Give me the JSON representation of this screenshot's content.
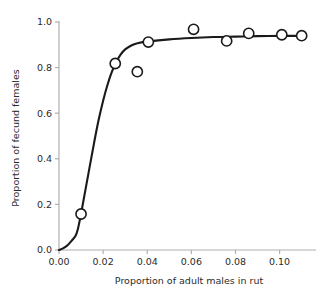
{
  "chart_data": {
    "type": "scatter",
    "title": "",
    "subtitle": "",
    "xlabel": "Proportion of adult males in rut",
    "ylabel": "Proportion of fecund females",
    "xlim": [
      0.0,
      0.1165
    ],
    "ylim": [
      0.0,
      1.0
    ],
    "xticks": [
      0.0,
      0.02,
      0.04,
      0.06,
      0.08,
      0.1
    ],
    "xticklabels": [
      "0.00",
      "0.02",
      "0.04",
      "0.06",
      "0.08",
      "0.10"
    ],
    "yticks": [
      0.0,
      0.2,
      0.4,
      0.6,
      0.8,
      1.0
    ],
    "yticklabels": [
      "0.0",
      "0.2",
      "0.4",
      "0.6",
      "0.8",
      "1.0"
    ],
    "grid": false,
    "legend": null,
    "series": [
      {
        "name": "observed",
        "type": "scatter",
        "marker": "open-circle",
        "marker_color": "#ffffff",
        "marker_edge_color": "#1a1a1a",
        "points": [
          {
            "x": 0.01,
            "y": 0.158
          },
          {
            "x": 0.0255,
            "y": 0.818
          },
          {
            "x": 0.0355,
            "y": 0.782
          },
          {
            "x": 0.0405,
            "y": 0.912
          },
          {
            "x": 0.061,
            "y": 0.968
          },
          {
            "x": 0.076,
            "y": 0.917
          },
          {
            "x": 0.086,
            "y": 0.95
          },
          {
            "x": 0.101,
            "y": 0.944
          },
          {
            "x": 0.11,
            "y": 0.94
          }
        ]
      },
      {
        "name": "fitted-curve",
        "type": "line",
        "color": "#1a1a1a",
        "points": [
          {
            "x": 0.0,
            "y": 0.0
          },
          {
            "x": 0.002,
            "y": 0.008
          },
          {
            "x": 0.004,
            "y": 0.022
          },
          {
            "x": 0.006,
            "y": 0.044
          },
          {
            "x": 0.0075,
            "y": 0.062
          },
          {
            "x": 0.0085,
            "y": 0.09
          },
          {
            "x": 0.0095,
            "y": 0.135
          },
          {
            "x": 0.0105,
            "y": 0.185
          },
          {
            "x": 0.012,
            "y": 0.265
          },
          {
            "x": 0.014,
            "y": 0.37
          },
          {
            "x": 0.016,
            "y": 0.475
          },
          {
            "x": 0.018,
            "y": 0.572
          },
          {
            "x": 0.02,
            "y": 0.655
          },
          {
            "x": 0.022,
            "y": 0.725
          },
          {
            "x": 0.024,
            "y": 0.782
          },
          {
            "x": 0.026,
            "y": 0.826
          },
          {
            "x": 0.028,
            "y": 0.858
          },
          {
            "x": 0.03,
            "y": 0.88
          },
          {
            "x": 0.033,
            "y": 0.898
          },
          {
            "x": 0.036,
            "y": 0.908
          },
          {
            "x": 0.0405,
            "y": 0.915
          },
          {
            "x": 0.05,
            "y": 0.924
          },
          {
            "x": 0.06,
            "y": 0.93
          },
          {
            "x": 0.07,
            "y": 0.934
          },
          {
            "x": 0.08,
            "y": 0.936
          },
          {
            "x": 0.09,
            "y": 0.938
          },
          {
            "x": 0.101,
            "y": 0.939
          },
          {
            "x": 0.11,
            "y": 0.939
          }
        ]
      }
    ],
    "colors": {
      "axis": "#b0b0b0",
      "text": "#2b2b2b",
      "curve": "#1a1a1a",
      "marker_fill": "#ffffff",
      "marker_edge": "#1a1a1a",
      "background": "#ffffff"
    }
  }
}
